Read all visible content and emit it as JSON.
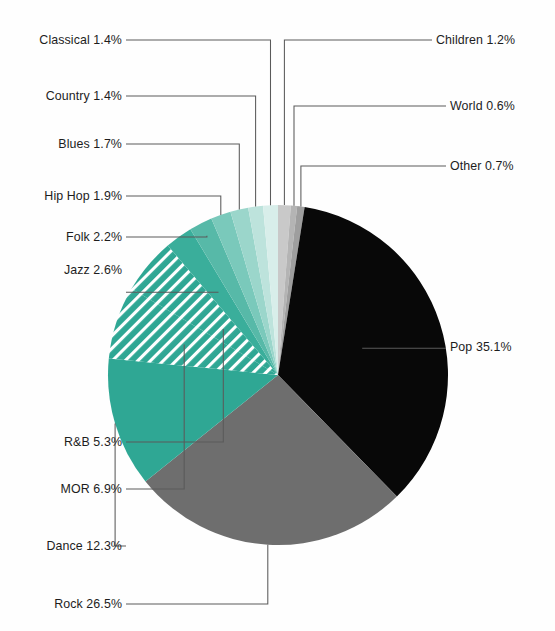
{
  "chart_data": {
    "type": "pie",
    "title": "",
    "subtitle": "",
    "xlabel": "",
    "ylabel": "",
    "legend_position": "callout-labels",
    "grid": false,
    "unit": "%",
    "start_angle_deg": 0,
    "direction": "clockwise",
    "categories": [
      "Children",
      "World",
      "Other",
      "Pop",
      "Rock",
      "Dance",
      "MOR",
      "R&B",
      "Jazz",
      "Folk",
      "Hip Hop",
      "Blues",
      "Country",
      "Classical"
    ],
    "values": [
      1.2,
      0.6,
      0.7,
      35.1,
      26.5,
      12.3,
      6.9,
      5.3,
      2.6,
      2.2,
      1.9,
      1.7,
      1.4,
      1.4
    ],
    "slices": [
      {
        "label": "Children",
        "value": 1.2,
        "text": "Children 1.2%",
        "color": "#c9c9c9",
        "pattern": "solid",
        "side": "right"
      },
      {
        "label": "World",
        "value": 0.6,
        "text": "World 0.6%",
        "color": "#b4b4b4",
        "pattern": "solid",
        "side": "right"
      },
      {
        "label": "Other",
        "value": 0.7,
        "text": "Other 0.7%",
        "color": "#9e9e9e",
        "pattern": "solid",
        "side": "right"
      },
      {
        "label": "Pop",
        "value": 35.1,
        "text": "Pop 35.1%",
        "color": "#080808",
        "pattern": "solid",
        "side": "right"
      },
      {
        "label": "Rock",
        "value": 26.5,
        "text": "Rock 26.5%",
        "color": "#6e6e6e",
        "pattern": "solid",
        "side": "left"
      },
      {
        "label": "Dance",
        "value": 12.3,
        "text": "Dance 12.3%",
        "color": "#2fa794",
        "pattern": "solid",
        "side": "left"
      },
      {
        "label": "MOR",
        "value": 6.9,
        "text": "MOR 6.9%",
        "color": "#2fa794",
        "pattern": "hatch",
        "side": "left"
      },
      {
        "label": "R&B",
        "value": 5.3,
        "text": "R&B 5.3%",
        "color": "#2fa794",
        "pattern": "hatch",
        "side": "left"
      },
      {
        "label": "Jazz",
        "value": 2.6,
        "text": "Jazz 2.6%",
        "color": "#3aae9b",
        "pattern": "solid",
        "side": "left"
      },
      {
        "label": "Folk",
        "value": 2.2,
        "text": "Folk 2.2%",
        "color": "#57b9a8",
        "pattern": "solid",
        "side": "left"
      },
      {
        "label": "Hip Hop",
        "value": 1.9,
        "text": "Hip Hop 1.9%",
        "color": "#7ac9bb",
        "pattern": "solid",
        "side": "left"
      },
      {
        "label": "Blues",
        "value": 1.7,
        "text": "Blues 1.7%",
        "color": "#9bd6cb",
        "pattern": "solid",
        "side": "left"
      },
      {
        "label": "Country",
        "value": 1.4,
        "text": "Country 1.4%",
        "color": "#bde3dc",
        "pattern": "solid",
        "side": "left"
      },
      {
        "label": "Classical",
        "value": 1.4,
        "text": "Classical 1.4%",
        "color": "#d8eeea",
        "pattern": "solid",
        "side": "left"
      }
    ],
    "colors": {
      "pop": "#080808",
      "rock": "#6e6e6e",
      "teal": "#2fa794",
      "teal_light": "#d8eeea",
      "neutral_small": "#c9c9c9",
      "leader_line": "#5a5a5a",
      "label_text": "#1d1d1d",
      "background": "#fefefe"
    }
  },
  "labels": {
    "classical": "Classical 1.4%",
    "country": "Country 1.4%",
    "blues": "Blues 1.7%",
    "hiphop": "Hip Hop 1.9%",
    "folk": "Folk 2.2%",
    "jazz": "Jazz 2.6%",
    "rnb": "R&B 5.3%",
    "mor": "MOR 6.9%",
    "dance": "Dance 12.3%",
    "rock": "Rock 26.5%",
    "children": "Children 1.2%",
    "world": "World 0.6%",
    "other": "Other 0.7%",
    "pop": "Pop 35.1%"
  }
}
